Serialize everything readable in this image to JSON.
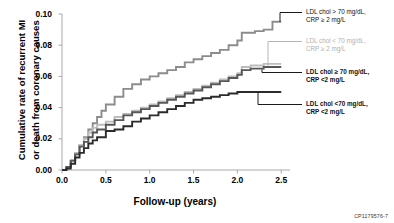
{
  "chart_data": {
    "type": "line",
    "title": "",
    "xlabel": "Follow-up (years)",
    "ylabel_line1": "Cumulative rate of recurrent MI",
    "ylabel_line2": "or death from coronary causes",
    "xlim": [
      0.0,
      2.6
    ],
    "ylim": [
      0.0,
      0.1
    ],
    "xticks": [
      "0.0",
      "0.5",
      "1.0",
      "1.5",
      "2.0",
      "2.5"
    ],
    "xtick_values": [
      0.0,
      0.5,
      1.0,
      1.5,
      2.0,
      2.5
    ],
    "yticks": [
      "0.00",
      "0.02",
      "0.04",
      "0.06",
      "0.08",
      "0.10"
    ],
    "ytick_values": [
      0.0,
      0.02,
      0.04,
      0.06,
      0.08,
      0.1
    ],
    "grid": false,
    "legend_position": "right",
    "corner_code": "CP1179576-7",
    "series": [
      {
        "name": "LDL chol > 70 mg/dL, CRP ≥ 2 mg/L",
        "label_line1": "LDL chol > 70 mg/dL,",
        "label_line2": "CRP ≥ 2 mg/L",
        "color": "#8c8c8c",
        "final_value": 0.095,
        "points": [
          [
            0.0,
            0.0
          ],
          [
            0.05,
            0.002
          ],
          [
            0.1,
            0.006
          ],
          [
            0.15,
            0.011
          ],
          [
            0.2,
            0.016
          ],
          [
            0.25,
            0.021
          ],
          [
            0.3,
            0.026
          ],
          [
            0.35,
            0.03
          ],
          [
            0.4,
            0.034
          ],
          [
            0.45,
            0.038
          ],
          [
            0.5,
            0.042
          ],
          [
            0.6,
            0.047
          ],
          [
            0.7,
            0.052
          ],
          [
            0.8,
            0.055
          ],
          [
            0.9,
            0.058
          ],
          [
            1.0,
            0.06
          ],
          [
            1.1,
            0.062
          ],
          [
            1.2,
            0.064
          ],
          [
            1.3,
            0.066
          ],
          [
            1.4,
            0.069
          ],
          [
            1.5,
            0.071
          ],
          [
            1.6,
            0.073
          ],
          [
            1.7,
            0.075
          ],
          [
            1.8,
            0.077
          ],
          [
            1.9,
            0.08
          ],
          [
            2.0,
            0.083
          ],
          [
            2.05,
            0.088
          ],
          [
            2.2,
            0.089
          ],
          [
            2.3,
            0.09
          ],
          [
            2.4,
            0.095
          ],
          [
            2.5,
            0.095
          ]
        ]
      },
      {
        "name": "LDL chol < 70 mg/dL, CRP ≥ 2 mg/L",
        "label_line1": "LDL chol < 70 mg/dL,",
        "label_line2": "CRP ≥ 2 mg/L",
        "color": "#bdbdbd",
        "final_value": 0.068,
        "points": [
          [
            0.0,
            0.0
          ],
          [
            0.05,
            0.002
          ],
          [
            0.1,
            0.006
          ],
          [
            0.15,
            0.011
          ],
          [
            0.2,
            0.016
          ],
          [
            0.25,
            0.02
          ],
          [
            0.3,
            0.024
          ],
          [
            0.35,
            0.027
          ],
          [
            0.4,
            0.029
          ],
          [
            0.5,
            0.031
          ],
          [
            0.6,
            0.034
          ],
          [
            0.7,
            0.036
          ],
          [
            0.8,
            0.038
          ],
          [
            0.9,
            0.04
          ],
          [
            1.0,
            0.042
          ],
          [
            1.1,
            0.044
          ],
          [
            1.2,
            0.046
          ],
          [
            1.3,
            0.048
          ],
          [
            1.4,
            0.05
          ],
          [
            1.5,
            0.052
          ],
          [
            1.6,
            0.054
          ],
          [
            1.7,
            0.056
          ],
          [
            1.8,
            0.058
          ],
          [
            1.9,
            0.06
          ],
          [
            2.0,
            0.062
          ],
          [
            2.05,
            0.066
          ],
          [
            2.15,
            0.067
          ],
          [
            2.3,
            0.068
          ],
          [
            2.5,
            0.068
          ]
        ]
      },
      {
        "name": "LDL chol ≥ 70 mg/dL, CRP <2 mg/L",
        "label_line1": "LDL chol ≥ 70 mg/dL,",
        "label_line2": "CRP <2 mg/L",
        "color": "#575757",
        "final_value": 0.066,
        "points": [
          [
            0.0,
            0.0
          ],
          [
            0.05,
            0.002
          ],
          [
            0.1,
            0.006
          ],
          [
            0.15,
            0.01
          ],
          [
            0.2,
            0.015
          ],
          [
            0.25,
            0.018
          ],
          [
            0.3,
            0.021
          ],
          [
            0.35,
            0.024
          ],
          [
            0.4,
            0.026
          ],
          [
            0.5,
            0.029
          ],
          [
            0.6,
            0.032
          ],
          [
            0.7,
            0.035
          ],
          [
            0.8,
            0.037
          ],
          [
            0.9,
            0.039
          ],
          [
            1.0,
            0.041
          ],
          [
            1.1,
            0.043
          ],
          [
            1.2,
            0.045
          ],
          [
            1.3,
            0.047
          ],
          [
            1.4,
            0.049
          ],
          [
            1.5,
            0.051
          ],
          [
            1.6,
            0.053
          ],
          [
            1.7,
            0.055
          ],
          [
            1.8,
            0.057
          ],
          [
            1.9,
            0.059
          ],
          [
            2.0,
            0.061
          ],
          [
            2.05,
            0.064
          ],
          [
            2.15,
            0.065
          ],
          [
            2.3,
            0.066
          ],
          [
            2.5,
            0.066
          ]
        ]
      },
      {
        "name": "LDL chol <70 mg/dL, CRP <2 mg/L",
        "label_line1": "LDL chol <70 mg/dL,",
        "label_line2": "CRP <2 mg/L",
        "color": "#2b2b2b",
        "final_value": 0.05,
        "points": [
          [
            0.0,
            0.0
          ],
          [
            0.05,
            0.001
          ],
          [
            0.1,
            0.004
          ],
          [
            0.15,
            0.008
          ],
          [
            0.2,
            0.011
          ],
          [
            0.25,
            0.014
          ],
          [
            0.3,
            0.017
          ],
          [
            0.35,
            0.019
          ],
          [
            0.4,
            0.021
          ],
          [
            0.5,
            0.025
          ],
          [
            0.6,
            0.026
          ],
          [
            0.7,
            0.028
          ],
          [
            0.8,
            0.031
          ],
          [
            0.9,
            0.033
          ],
          [
            1.0,
            0.035
          ],
          [
            1.1,
            0.037
          ],
          [
            1.2,
            0.039
          ],
          [
            1.3,
            0.041
          ],
          [
            1.4,
            0.043
          ],
          [
            1.5,
            0.045
          ],
          [
            1.6,
            0.046
          ],
          [
            1.7,
            0.047
          ],
          [
            1.8,
            0.048
          ],
          [
            1.9,
            0.049
          ],
          [
            2.0,
            0.05
          ],
          [
            2.2,
            0.05
          ],
          [
            2.5,
            0.05
          ]
        ]
      }
    ]
  }
}
